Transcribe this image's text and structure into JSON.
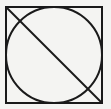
{
  "diagram": {
    "background": "#f4f4f2",
    "stroke": "#1a1a1a",
    "square": {
      "x": 6,
      "y": 7,
      "size": 96
    },
    "circle": {
      "cx": 54,
      "cy": 55,
      "r": 48
    },
    "diagonal": {
      "x1": 6,
      "y1": 7,
      "x2": 102,
      "y2": 103
    }
  }
}
